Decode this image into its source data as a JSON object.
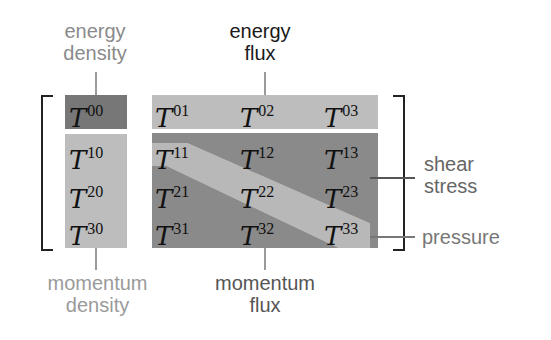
{
  "figure": {
    "labels": {
      "energy_density": [
        "energy",
        "density"
      ],
      "energy_flux": [
        "energy",
        "flux"
      ],
      "momentum_density": [
        "momentum",
        "density"
      ],
      "momentum_flux": [
        "momentum",
        "flux"
      ],
      "shear_stress": [
        "shear",
        "stress"
      ],
      "pressure": "pressure"
    },
    "tensor_symbol": "T",
    "cells": {
      "t00": "00",
      "col0": [
        "10",
        "20",
        "30"
      ],
      "row0": [
        "01",
        "02",
        "03"
      ],
      "inner": [
        [
          "11",
          "12",
          "13"
        ],
        [
          "21",
          "22",
          "23"
        ],
        [
          "31",
          "32",
          "33"
        ]
      ]
    },
    "colors": {
      "energy_density_box": "#777777",
      "light_box": "#bdbdbd",
      "inner_box": "#8c8c8c",
      "diagonal_band": "#b8b8b8",
      "bracket": "#222222",
      "connector": "#9a9a9a"
    }
  }
}
